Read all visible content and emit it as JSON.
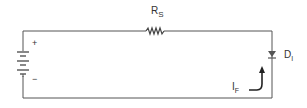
{
  "diagram": {
    "type": "circuit",
    "components": {
      "battery": {
        "positive_label": "+",
        "negative_label": "−"
      },
      "resistor": {
        "label_main": "R",
        "label_sub": "S"
      },
      "diode": {
        "label_main": "D",
        "label_sub": "I"
      },
      "current": {
        "label_main": "I",
        "label_sub": "F",
        "direction": "up"
      }
    },
    "colors": {
      "wire": "#555555",
      "text": "#333333",
      "background": "#ffffff"
    }
  }
}
